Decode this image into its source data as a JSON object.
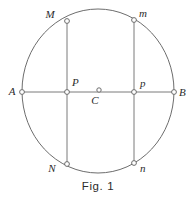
{
  "figure": {
    "caption": "Fig. 1",
    "background_color": "#ffffff",
    "stroke_color": "#6d6d6d",
    "text_color": "#2b2b2b",
    "width": 196,
    "height": 200
  },
  "geometry": {
    "circle": {
      "name": "main-circle",
      "center_x": 98,
      "center_y": 91,
      "radius_x": 76,
      "radius_y": 82
    },
    "diameter": {
      "name": "diameter-AB",
      "from": "A",
      "to": "B",
      "x1": 22,
      "y1": 92,
      "x2": 174,
      "y2": 92
    },
    "chords": [
      {
        "name": "chord-MN",
        "from": "M",
        "to": "N",
        "x1": 67,
        "y1": 21,
        "x2": 67,
        "y2": 164
      },
      {
        "name": "chord-mn",
        "from": "m",
        "to": "n",
        "x1": 134,
        "y1": 20,
        "x2": 134,
        "y2": 163
      }
    ]
  },
  "points": [
    {
      "id": "M",
      "label": "M",
      "x": 67,
      "y": 21,
      "label_x": 50,
      "label_y": 18,
      "radius": 2.4
    },
    {
      "id": "m",
      "label": "m",
      "x": 134,
      "y": 20,
      "label_x": 143,
      "label_y": 17,
      "radius": 2.4
    },
    {
      "id": "A",
      "label": "A",
      "x": 22,
      "y": 92,
      "label_x": 12,
      "label_y": 95,
      "radius": 2.4
    },
    {
      "id": "P",
      "label": "P",
      "x": 67,
      "y": 92,
      "label_x": 72,
      "label_y": 86,
      "radius": 2.4
    },
    {
      "id": "C",
      "label": "C",
      "x": 99,
      "y": 90,
      "label_x": 95,
      "label_y": 104,
      "radius": 2.2
    },
    {
      "id": "p",
      "label": "p",
      "x": 134,
      "y": 92,
      "label_x": 140,
      "label_y": 87,
      "radius": 2.4
    },
    {
      "id": "B",
      "label": "B",
      "x": 174,
      "y": 92,
      "label_x": 179,
      "label_y": 96,
      "radius": 2.4
    },
    {
      "id": "N",
      "label": "N",
      "x": 67,
      "y": 164,
      "label_x": 52,
      "label_y": 172,
      "radius": 2.4
    },
    {
      "id": "n",
      "label": "n",
      "x": 134,
      "y": 163,
      "label_x": 140,
      "label_y": 172,
      "radius": 2.4
    }
  ],
  "caption": {
    "text": "Fig. 1",
    "x": 98,
    "y": 190
  }
}
